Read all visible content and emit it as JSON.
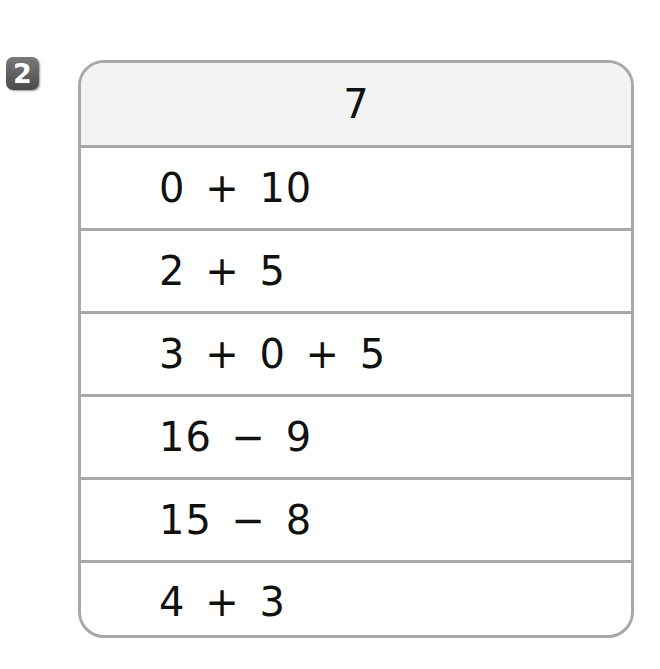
{
  "problem": {
    "number": "2"
  },
  "table": {
    "header": "7",
    "rows": [
      {
        "expression": "0 + 10"
      },
      {
        "expression": "2 + 5"
      },
      {
        "expression": "3 + 0 + 5"
      },
      {
        "expression": "16 − 9"
      },
      {
        "expression": "15 − 8"
      },
      {
        "expression": "4 + 3"
      }
    ]
  },
  "colors": {
    "border": "#a8a8a8",
    "header_bg": "#f3f3f3",
    "badge_bg": "#5a5a5a",
    "text": "#111111"
  }
}
